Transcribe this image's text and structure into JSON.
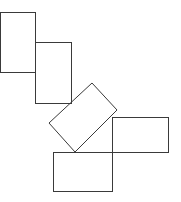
{
  "canvas": {
    "width": 181,
    "height": 202,
    "background": "#ffffff",
    "stroke": "#3a3a3a"
  },
  "shapes": [
    {
      "id": "rect-top-left",
      "type": "rect",
      "x": 0,
      "y": 12,
      "width": 35,
      "height": 60
    },
    {
      "id": "rect-upper-middle",
      "type": "rect",
      "x": 35,
      "y": 42,
      "width": 36,
      "height": 61
    },
    {
      "id": "rect-rotated",
      "type": "polygon",
      "points": "92,83 117,110 75,152 49,123"
    },
    {
      "id": "rect-right",
      "type": "rect",
      "x": 112,
      "y": 117,
      "width": 56,
      "height": 35
    },
    {
      "id": "rect-bottom",
      "type": "rect",
      "x": 53,
      "y": 152,
      "width": 59,
      "height": 39
    }
  ]
}
